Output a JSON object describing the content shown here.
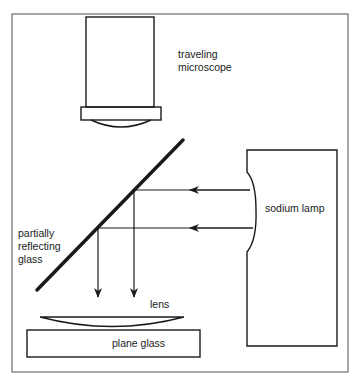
{
  "diagram": {
    "type": "optical-apparatus",
    "components": {
      "microscope": {
        "label": "traveling\nmicroscope"
      },
      "lamp": {
        "label": "sodium lamp"
      },
      "mirror": {
        "label": "partially\nreflecting\nglass"
      },
      "lens": {
        "label": "lens"
      },
      "plate": {
        "label": "plane glass"
      }
    },
    "colors": {
      "stroke": "#1a1a1a",
      "frame": "#6e6e6e",
      "background": "#ffffff"
    }
  }
}
